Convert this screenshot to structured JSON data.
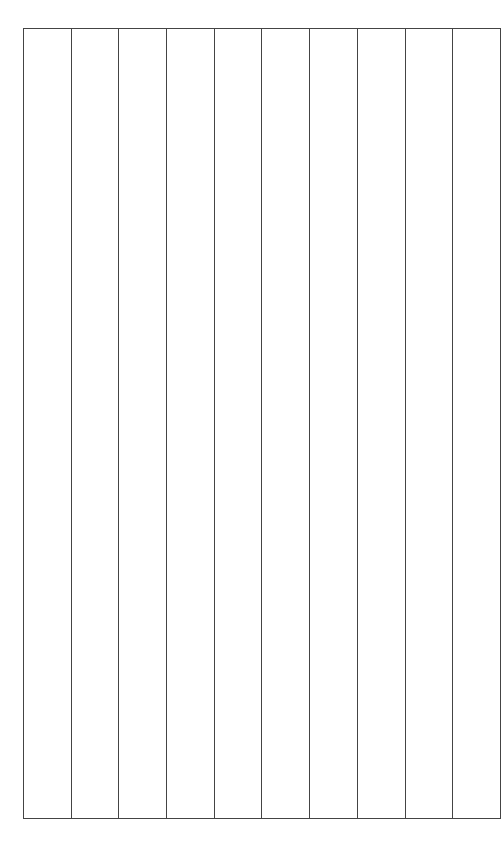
{
  "grid": {
    "column_count": 10,
    "row_count": 1,
    "line_color": "#444444",
    "background": "#ffffff",
    "columns": [
      {
        "label": ""
      },
      {
        "label": ""
      },
      {
        "label": ""
      },
      {
        "label": ""
      },
      {
        "label": ""
      },
      {
        "label": ""
      },
      {
        "label": ""
      },
      {
        "label": ""
      },
      {
        "label": ""
      },
      {
        "label": ""
      }
    ]
  }
}
